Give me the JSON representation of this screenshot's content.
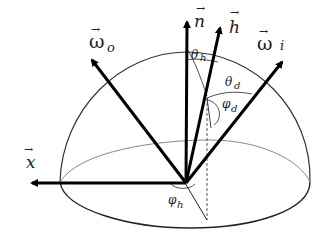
{
  "diagram": {
    "type": "hemisphere-vector-diagram",
    "colors": {
      "stroke": "#111111",
      "thin_stroke": "#333333",
      "equator": "#888888",
      "background": "#ffffff"
    },
    "vectors": [
      {
        "id": "n",
        "label": "n",
        "arrow_over": "→"
      },
      {
        "id": "h",
        "label": "h",
        "arrow_over": "→"
      },
      {
        "id": "omega_i",
        "label": "ω",
        "subscript": "i",
        "arrow_over": "→"
      },
      {
        "id": "omega_o",
        "label": "ω",
        "subscript": "o",
        "arrow_over": "→"
      },
      {
        "id": "x",
        "label": "x",
        "arrow_over": "→"
      }
    ],
    "angles": [
      {
        "id": "theta_h",
        "symbol": "θ",
        "subscript": "h"
      },
      {
        "id": "theta_d",
        "symbol": "θ",
        "subscript": "d"
      },
      {
        "id": "phi_d",
        "symbol": "φ",
        "subscript": "d"
      },
      {
        "id": "phi_h",
        "symbol": "φ",
        "subscript": "h"
      }
    ]
  }
}
